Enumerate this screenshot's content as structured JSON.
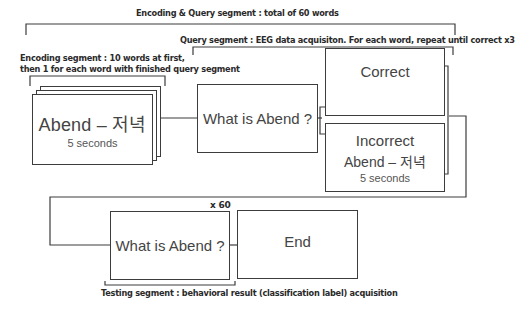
{
  "labels": {
    "encoding_query": "Encoding & Query segment : total of 60 words",
    "query": "Query segment : EEG data acquisiton. For each word, repeat until correct x3",
    "encoding_line1": "Encoding segment : 10 words at first,",
    "encoding_line2": "then 1 for each word with finished query segment",
    "repeat": "x 60",
    "testing": "Testing segment : behavioral result (classification label) acquisition"
  },
  "boxes": {
    "encoding_card": {
      "word": "Abend – 저녁",
      "duration": "5 seconds"
    },
    "query": {
      "prompt": "What is Abend ?"
    },
    "correct": {
      "label": "Correct"
    },
    "incorrect": {
      "label": "Incorrect",
      "word": "Abend – 저녁",
      "duration": "5 seconds"
    },
    "test": {
      "prompt": "What is Abend ?"
    },
    "end": {
      "label": "End"
    }
  },
  "colors": {
    "line": "#3c3c3c",
    "text": "#2a2a2a"
  }
}
